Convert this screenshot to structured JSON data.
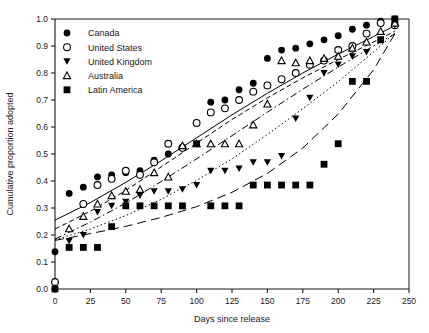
{
  "chart_data": {
    "type": "scatter",
    "title": "",
    "subtitle": "",
    "xlabel": "Days since release",
    "ylabel": "Cumulative proportion adopted",
    "xlim": [
      0,
      250
    ],
    "ylim": [
      0.0,
      1.0
    ],
    "xticks": [
      0,
      25,
      50,
      75,
      100,
      125,
      150,
      175,
      200,
      225,
      250
    ],
    "yticks": [
      0.0,
      0.1,
      0.2,
      0.3,
      0.4,
      0.5,
      0.6,
      0.7,
      0.8,
      0.9,
      1.0
    ],
    "ytick_labels": [
      "0.0",
      "0.1",
      "0.2",
      "0.3",
      "0.4",
      "0.5",
      "0.6",
      "0.7",
      "0.8",
      "0.9",
      "1.0"
    ],
    "xtick_labels": [
      "0",
      "25",
      "50",
      "75",
      "100",
      "125",
      "150",
      "175",
      "200",
      "225",
      "250"
    ],
    "grid": false,
    "legend_position": "upper-left",
    "series": [
      {
        "name": "Canada",
        "marker": "filled-circle",
        "fit_line": "solid",
        "color": "#000000",
        "x": [
          0,
          10,
          20,
          30,
          40,
          50,
          60,
          70,
          80,
          90,
          100,
          110,
          120,
          130,
          140,
          150,
          160,
          170,
          180,
          190,
          200,
          210,
          220,
          230,
          240
        ],
        "y": [
          0.138,
          0.354,
          0.377,
          0.415,
          0.423,
          0.431,
          0.438,
          0.477,
          0.5,
          0.523,
          0.615,
          0.692,
          0.7,
          0.738,
          0.762,
          0.854,
          0.885,
          0.892,
          0.908,
          0.923,
          0.938,
          0.962,
          0.977,
          0.992,
          1.0
        ]
      },
      {
        "name": "United States",
        "marker": "open-circle",
        "fit_line": "dashed-short",
        "color": "#000000",
        "x": [
          0,
          20,
          30,
          40,
          50,
          60,
          70,
          80,
          90,
          100,
          110,
          120,
          130,
          140,
          150,
          160,
          170,
          180,
          190,
          200,
          210,
          220,
          230,
          240
        ],
        "y": [
          0.026,
          0.315,
          0.385,
          0.408,
          0.438,
          0.423,
          0.469,
          0.538,
          0.523,
          0.615,
          0.654,
          0.669,
          0.7,
          0.731,
          0.754,
          0.777,
          0.8,
          0.831,
          0.846,
          0.885,
          0.9,
          0.946,
          0.985,
          0.977
        ]
      },
      {
        "name": "United Kingdom",
        "marker": "filled-triangle-down",
        "fit_line": "dotted",
        "color": "#000000",
        "x": [
          10,
          20,
          30,
          40,
          50,
          60,
          70,
          80,
          90,
          100,
          110,
          120,
          130,
          140,
          150,
          160,
          170,
          180,
          190,
          200,
          210,
          220,
          230,
          240
        ],
        "y": [
          0.177,
          0.2,
          0.285,
          0.308,
          0.323,
          0.346,
          0.362,
          0.362,
          0.369,
          0.385,
          0.438,
          0.438,
          0.446,
          0.469,
          0.469,
          0.492,
          0.631,
          0.708,
          0.8,
          0.831,
          0.862,
          0.877,
          0.923,
          0.977
        ]
      },
      {
        "name": "Australia",
        "marker": "open-triangle-up",
        "fit_line": "dash-dot",
        "color": "#000000",
        "x": [
          10,
          20,
          30,
          40,
          50,
          60,
          70,
          80,
          90,
          100,
          110,
          120,
          130,
          140,
          150,
          160,
          170,
          180,
          190,
          200,
          210,
          220,
          230,
          240
        ],
        "y": [
          0.223,
          0.269,
          0.315,
          0.346,
          0.362,
          0.369,
          0.431,
          0.415,
          0.531,
          0.538,
          0.538,
          0.538,
          0.538,
          0.608,
          0.685,
          0.846,
          0.838,
          0.846,
          0.854,
          0.862,
          0.892,
          0.915,
          0.954,
          0.985
        ]
      },
      {
        "name": "Latin America",
        "marker": "filled-square",
        "fit_line": "dashed-long",
        "color": "#000000",
        "x": [
          0,
          10,
          20,
          30,
          40,
          50,
          60,
          70,
          80,
          90,
          100,
          110,
          120,
          130,
          140,
          150,
          160,
          170,
          180,
          190,
          200,
          210,
          220,
          230,
          240
        ],
        "y": [
          0.0,
          0.154,
          0.154,
          0.154,
          0.231,
          0.308,
          0.308,
          0.308,
          0.308,
          0.308,
          0.538,
          0.308,
          0.308,
          0.308,
          0.385,
          0.385,
          0.385,
          0.385,
          0.385,
          0.462,
          0.538,
          0.769,
          0.769,
          0.923,
          1.0
        ]
      }
    ],
    "fit_curves": [
      {
        "name": "Canada fit",
        "style": "solid",
        "points": [
          [
            0,
            0.255
          ],
          [
            25,
            0.32
          ],
          [
            50,
            0.395
          ],
          [
            75,
            0.475
          ],
          [
            100,
            0.56
          ],
          [
            125,
            0.645
          ],
          [
            150,
            0.725
          ],
          [
            175,
            0.8
          ],
          [
            200,
            0.87
          ],
          [
            225,
            0.935
          ],
          [
            240,
            0.975
          ]
        ]
      },
      {
        "name": "United States fit",
        "style": "dashed-short",
        "points": [
          [
            0,
            0.222
          ],
          [
            25,
            0.288
          ],
          [
            50,
            0.365
          ],
          [
            75,
            0.452
          ],
          [
            100,
            0.54
          ],
          [
            125,
            0.628
          ],
          [
            150,
            0.708
          ],
          [
            175,
            0.782
          ],
          [
            200,
            0.85
          ],
          [
            225,
            0.915
          ],
          [
            240,
            0.955
          ]
        ]
      },
      {
        "name": "Australia fit",
        "style": "dash-dot",
        "points": [
          [
            0,
            0.185
          ],
          [
            25,
            0.248
          ],
          [
            50,
            0.318
          ],
          [
            75,
            0.398
          ],
          [
            100,
            0.482
          ],
          [
            125,
            0.568
          ],
          [
            150,
            0.655
          ],
          [
            175,
            0.74
          ],
          [
            200,
            0.822
          ],
          [
            225,
            0.9
          ],
          [
            240,
            0.945
          ]
        ]
      },
      {
        "name": "United Kingdom fit",
        "style": "dotted",
        "points": [
          [
            0,
            0.182
          ],
          [
            25,
            0.222
          ],
          [
            50,
            0.272
          ],
          [
            75,
            0.332
          ],
          [
            100,
            0.402
          ],
          [
            125,
            0.482
          ],
          [
            150,
            0.572
          ],
          [
            175,
            0.668
          ],
          [
            200,
            0.768
          ],
          [
            225,
            0.878
          ],
          [
            240,
            0.948
          ]
        ]
      },
      {
        "name": "Latin America fit",
        "style": "dashed-long",
        "points": [
          [
            0,
            0.18
          ],
          [
            25,
            0.205
          ],
          [
            50,
            0.232
          ],
          [
            75,
            0.265
          ],
          [
            100,
            0.305
          ],
          [
            125,
            0.358
          ],
          [
            150,
            0.428
          ],
          [
            175,
            0.522
          ],
          [
            200,
            0.648
          ],
          [
            225,
            0.812
          ],
          [
            240,
            0.945
          ]
        ]
      }
    ],
    "legend": [
      {
        "label": "Canada",
        "marker": "filled-circle"
      },
      {
        "label": "United States",
        "marker": "open-circle"
      },
      {
        "label": "United Kingdom",
        "marker": "filled-triangle-down"
      },
      {
        "label": "Australia",
        "marker": "open-triangle-up"
      },
      {
        "label": "Latin America",
        "marker": "filled-square"
      }
    ]
  }
}
